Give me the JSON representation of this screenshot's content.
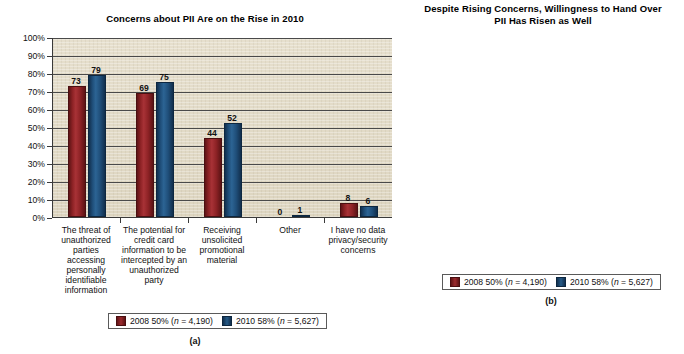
{
  "chart_data": [
    {
      "type": "bar",
      "id": "a",
      "title": "Concerns about PII Are on the Rise in 2010",
      "figure_label": "(a)",
      "categories": [
        "The threat of unauthorized parties accessing personally identifiable information",
        "The potential for credit card information to be intercepted by an unauthorized party",
        "Receiving unsolicited promotional material",
        "Other",
        "I have no data privacy/security concerns"
      ],
      "series": [
        {
          "name": "2008 50% (n = 4,190)",
          "color": "#8d2225",
          "values": [
            73,
            69,
            44,
            0,
            8
          ]
        },
        {
          "name": "2010 58% (n = 5,627)",
          "color": "#1f4e79",
          "values": [
            79,
            75,
            52,
            1,
            6
          ]
        }
      ],
      "ylim": [
        0,
        100
      ],
      "yticks": [
        "0%",
        "10%",
        "20%",
        "30%",
        "40%",
        "50%",
        "60%",
        "70%",
        "80%",
        "90%",
        "100%"
      ],
      "xlabel": "",
      "ylabel": "",
      "grid": true,
      "legend_position": "bottom"
    },
    {
      "type": "bar",
      "id": "b",
      "title": "Despite Rising Concerns, Willingness to Hand Over PII Has Risen as Well",
      "figure_label": "(b)",
      "categories": [
        "Very willing",
        "Somewhat willing",
        "Not at all willing",
        "Those who spend no time online"
      ],
      "series": [
        {
          "name": "2008 50% (n = 4,190)",
          "color": "#8d2225",
          "values": [
            14,
            36,
            49,
            1
          ]
        },
        {
          "name": "2010 58% (n = 5,627)",
          "color": "#1f4e79",
          "values": [
            14,
            44,
            42,
            0
          ]
        }
      ],
      "ylim": [
        0,
        100
      ],
      "yticks": [
        "0%",
        "10%",
        "20%",
        "30%",
        "40%",
        "50%",
        "60%",
        "70%",
        "80%",
        "90%",
        "100%"
      ],
      "xlabel": "",
      "ylabel": "",
      "grid": true,
      "legend_position": "bottom"
    }
  ],
  "legend": {
    "series_2008_prefix": "2008 50% (",
    "series_2008_n": "n",
    "series_2008_suffix": " = 4,190)",
    "series_2010_prefix": "2010 58% (",
    "series_2010_n": "n",
    "series_2010_suffix": " = 5,627)"
  }
}
